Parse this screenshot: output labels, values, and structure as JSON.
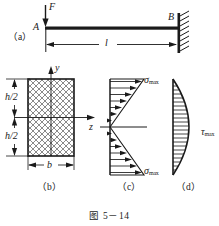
{
  "figure": {
    "caption": "图 5－14",
    "panels": [
      {
        "id": "a",
        "tag": "（a）"
      },
      {
        "id": "b",
        "tag": "（b）"
      },
      {
        "id": "c",
        "tag": "（c）"
      },
      {
        "id": "d",
        "tag": "（d）"
      }
    ]
  },
  "beam": {
    "load_label": "F",
    "free_end_label": "A",
    "fixed_end_label": "B",
    "span_label": "l"
  },
  "section": {
    "axis_y_label": "y",
    "axis_z_label": "z",
    "half_height_top_label": "h/2",
    "half_height_bottom_label": "h/2",
    "width_label": "b"
  },
  "normal_stress": {
    "top_label": "σ",
    "top_sub": "max",
    "bottom_label": "σ",
    "bottom_sub": "max"
  },
  "shear_stress": {
    "label": "τ",
    "sub": "max"
  },
  "colors": {
    "ink": "#1a1a1a",
    "paper": "#ffffff"
  }
}
